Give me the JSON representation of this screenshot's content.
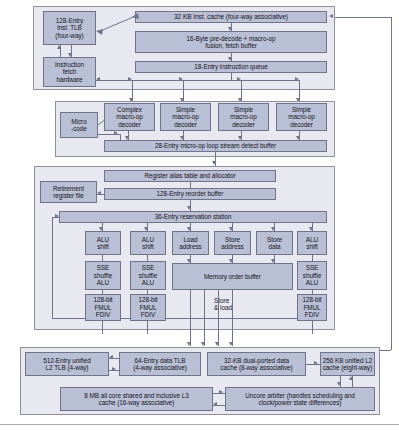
{
  "diagram": {
    "colors": {
      "box_fill": "#b9bfd4",
      "box_border": "#6f7488",
      "group_fill": "#e8e8f0",
      "line": "#6f7488",
      "page_background": "#ffffff"
    },
    "front_end": {
      "inst_tlb": "128-Entry\ninst. TLB\n(four-way)",
      "inst_tlb_lines": [
        "128-Entry",
        "inst. TLB",
        "(four-way)"
      ],
      "fetch_hardware_lines": [
        "Instruction",
        "fetch",
        "hardware"
      ],
      "inst_cache": "32 KB Inst. cache (four-way associative)",
      "predecode_lines": [
        "16-Byte pre-decode + macro-op",
        "fusion, fetch buffer"
      ],
      "instruction_queue": "18-Entry instruction queue"
    },
    "decode": {
      "microcode_lines": [
        "Micro",
        "-code"
      ],
      "decoders": [
        {
          "lines": [
            "Complex",
            "macro-op",
            "decoder"
          ]
        },
        {
          "lines": [
            "Simple",
            "macro-op",
            "decoder"
          ]
        },
        {
          "lines": [
            "Simple",
            "macro-op",
            "decoder"
          ]
        },
        {
          "lines": [
            "Simple",
            "macro-op",
            "decoder"
          ]
        }
      ],
      "loop_buffer": "28-Entry micro-op loop stream detect buffer"
    },
    "out_of_order": {
      "register_alias_table": "Register alias table and allocator",
      "retirement_register_file_lines": [
        "Retirement",
        "register file"
      ],
      "reorder_buffer": "128-Entry reorder buffer",
      "reservation_station": "36-Entry reservation station",
      "ports": [
        {
          "lines": [
            "ALU",
            "shift"
          ]
        },
        {
          "lines": [
            "ALU",
            "shift"
          ]
        },
        {
          "lines": [
            "Load",
            "address"
          ]
        },
        {
          "lines": [
            "Store",
            "address"
          ]
        },
        {
          "lines": [
            "Store",
            "data"
          ]
        },
        {
          "lines": [
            "ALU",
            "shift"
          ]
        }
      ],
      "sse_units": [
        {
          "lines": [
            "SSE",
            "shuffle",
            "ALU"
          ]
        },
        {
          "lines": [
            "SSE",
            "shuffle",
            "ALU"
          ]
        },
        {
          "lines": [
            "SSE",
            "shuffle",
            "ALU"
          ]
        }
      ],
      "fp_units": [
        {
          "lines": [
            "128-bit",
            "FMUL",
            "FDIV"
          ]
        },
        {
          "lines": [
            "128-bit",
            "FMUL",
            "FDIV"
          ]
        },
        {
          "lines": [
            "128-bit",
            "FMUL",
            "FDIV"
          ]
        }
      ],
      "memory_order_buffer": "Memory order buffer",
      "store_and_load_lines": [
        "Store",
        "& load"
      ]
    },
    "memory_hierarchy": {
      "l2_tlb_lines": [
        "512-Entry unified",
        "L2 TLB (4-way)"
      ],
      "data_tlb_lines": [
        "64-Entry data TLB",
        "(4-way associative)"
      ],
      "data_cache_lines": [
        "32-KB dual-ported data",
        "cache (8-way associative)"
      ],
      "l2_cache_lines": [
        "256 KB unified L2",
        "cache (eight-way)"
      ],
      "l3_cache_lines": [
        "8 MB all core shared and inclusive L3",
        "cache (16-way associative)"
      ],
      "uncore_arbiter_lines": [
        "Uncore arbiter (handles scheduling and",
        "clock/power state differences)"
      ]
    }
  }
}
